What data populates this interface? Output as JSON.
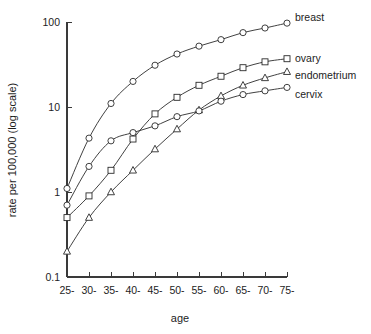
{
  "chart_data": {
    "type": "line",
    "title": "",
    "subtitle": "",
    "xlabel": "age",
    "ylabel": "rate per 100,000 (log scale)",
    "yscale": "log",
    "ylim": [
      0.1,
      100
    ],
    "ytick_labels": [
      "100",
      "10",
      "1",
      "0.1"
    ],
    "ytick_values": [
      100,
      10,
      1,
      0.1
    ],
    "grid": false,
    "legend_position": "right-of-plot-end-labels",
    "categories": [
      "25-",
      "30-",
      "35-",
      "40-",
      "45-",
      "50-",
      "55-",
      "60-",
      "65-",
      "70-",
      "75-"
    ],
    "x": [
      25,
      30,
      35,
      40,
      45,
      50,
      55,
      60,
      65,
      70,
      75
    ],
    "series": [
      {
        "name": "breast",
        "marker": "circle",
        "values": [
          1.1,
          4.3,
          11.0,
          20.0,
          31.0,
          42.0,
          52.0,
          62.0,
          75.0,
          85.0,
          97.0
        ]
      },
      {
        "name": "ovary",
        "marker": "square",
        "values": [
          0.5,
          0.9,
          1.8,
          4.2,
          8.3,
          13.0,
          18.0,
          23.0,
          29.0,
          34.0,
          37.0
        ]
      },
      {
        "name": "endometrium",
        "marker": "triangle",
        "values": [
          0.2,
          0.5,
          1.0,
          1.8,
          3.2,
          5.5,
          9.2,
          13.5,
          18.0,
          22.0,
          26.0
        ]
      },
      {
        "name": "cervix",
        "marker": "circle",
        "values": [
          0.7,
          2.0,
          4.0,
          5.0,
          6.0,
          7.7,
          9.0,
          11.7,
          14.0,
          15.5,
          17.0
        ]
      }
    ],
    "colors": {
      "axis": "#3a3a3a",
      "line": "#2b2b2b",
      "marker_fill": "#ffffff",
      "text": "#1d1d1d",
      "background": "#ffffff"
    }
  },
  "plot_geometry": {
    "x_left_px": 67,
    "x_step_px": 22,
    "y_top_px": 22,
    "y_bottom_px": 277,
    "decade_px": 85
  }
}
